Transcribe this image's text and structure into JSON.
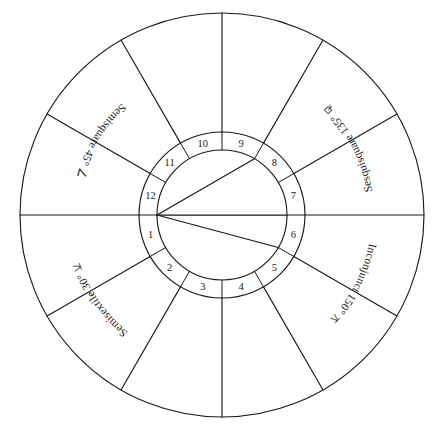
{
  "diagram": {
    "background_color": "#ffffff",
    "line_color": "#1a1a1a"
  },
  "geometry": {
    "center_x": 222,
    "center_y": 215,
    "outer_radius": 202,
    "ring_outer_radius": 83,
    "ring_inner_radius": 65,
    "house_count": 12,
    "cusp_start_angle_deg": 180,
    "cusp_step_deg": 30
  },
  "houses": [
    {
      "number": "1",
      "mid_angle_deg": 195
    },
    {
      "number": "2",
      "mid_angle_deg": 225
    },
    {
      "number": "3",
      "mid_angle_deg": 255
    },
    {
      "number": "4",
      "mid_angle_deg": 285
    },
    {
      "number": "5",
      "mid_angle_deg": 315
    },
    {
      "number": "6",
      "mid_angle_deg": 345
    },
    {
      "number": "7",
      "mid_angle_deg": 15
    },
    {
      "number": "8",
      "mid_angle_deg": 45
    },
    {
      "number": "9",
      "mid_angle_deg": 75
    },
    {
      "number": "10",
      "mid_angle_deg": 105
    },
    {
      "number": "11",
      "mid_angle_deg": 135
    },
    {
      "number": "12",
      "mid_angle_deg": 165
    }
  ],
  "aspect_labels": [
    {
      "id": "semisquare",
      "name": "Semisquare",
      "degrees": "45",
      "degree_symbol": "°",
      "text": "Semisquare 45°",
      "glyph": "∠",
      "glyph_name": "semisquare-glyph",
      "path_start_angle_deg": 131,
      "path_end_angle_deg": 172,
      "path_radius": 150
    },
    {
      "id": "sesquisquare",
      "name": "Sesquisquare",
      "degrees": "135",
      "degree_symbol": "°",
      "text": "Sesquisquare 135°",
      "glyph": "⚼",
      "glyph_name": "sesquisquare-glyph",
      "path_start_angle_deg": 8,
      "path_end_angle_deg": 52,
      "path_radius": 152
    },
    {
      "id": "inconjunct",
      "name": "Inconjunct",
      "degrees": "150",
      "degree_symbol": "°",
      "text": "Inconjunct 150°",
      "glyph": "⚻",
      "glyph_name": "inconjunct-glyph",
      "path_start_angle_deg": 350,
      "path_end_angle_deg": 308,
      "path_radius": 150
    },
    {
      "id": "semisextile",
      "name": "Semisextile",
      "degrees": "30",
      "degree_symbol": "°",
      "text": "Semisextile 30°",
      "glyph": "⚺",
      "glyph_name": "semisextile-glyph",
      "path_start_angle_deg": 232,
      "path_end_angle_deg": 190,
      "path_radius": 150
    }
  ],
  "aspect_lines": [
    {
      "id": "line-to-sesquisquare",
      "from_angle_deg": 180,
      "to_angle_deg": 60
    },
    {
      "id": "line-to-inconjunct",
      "from_angle_deg": 180,
      "to_angle_deg": 330
    },
    {
      "id": "line-to-opposition",
      "from_angle_deg": 180,
      "to_angle_deg": 0
    }
  ]
}
